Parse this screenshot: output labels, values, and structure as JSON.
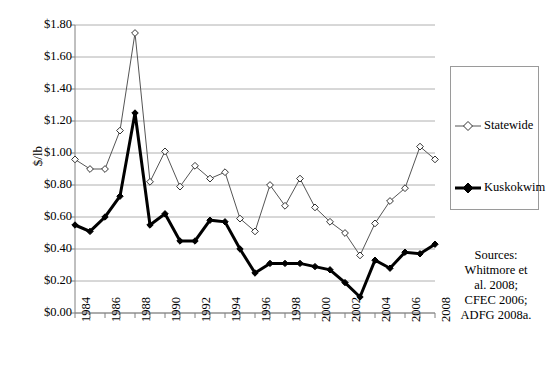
{
  "chart_data": {
    "type": "line",
    "title": "",
    "xlabel": "",
    "ylabel": "$/lb",
    "ylim": [
      0,
      1.8
    ],
    "ytick_step": 0.2,
    "ytick_labels": [
      "$0.00",
      "$0.20",
      "$0.40",
      "$0.60",
      "$0.80",
      "$1.00",
      "$1.20",
      "$1.40",
      "$1.60",
      "$1.80"
    ],
    "x": [
      1984,
      1985,
      1986,
      1987,
      1988,
      1989,
      1990,
      1991,
      1992,
      1993,
      1994,
      1995,
      1996,
      1997,
      1998,
      1999,
      2000,
      2001,
      2002,
      2003,
      2004,
      2005,
      2006,
      2007,
      2008
    ],
    "xtick_labels": [
      "1984",
      "1986",
      "1988",
      "1990",
      "1992",
      "1994",
      "1996",
      "1998",
      "2000",
      "2002",
      "2004",
      "2006",
      "2008"
    ],
    "xtick_values": [
      1984,
      1986,
      1988,
      1990,
      1992,
      1994,
      1996,
      1998,
      2000,
      2002,
      2004,
      2006,
      2008
    ],
    "grid": "horizontal",
    "legend_position": "right",
    "series": [
      {
        "name": "Statewide",
        "color": "#555555",
        "marker": "diamond-open",
        "line_width": 1,
        "values": [
          0.96,
          0.9,
          0.9,
          1.14,
          1.75,
          0.82,
          1.01,
          0.79,
          0.92,
          0.84,
          0.88,
          0.59,
          0.51,
          0.8,
          0.67,
          0.84,
          0.66,
          0.57,
          0.5,
          0.36,
          0.56,
          0.7,
          0.78,
          1.04,
          0.96
        ]
      },
      {
        "name": "Kuskokwim",
        "color": "#000000",
        "marker": "diamond-filled",
        "line_width": 3,
        "values": [
          0.55,
          0.51,
          0.6,
          0.73,
          1.25,
          0.55,
          0.62,
          0.45,
          0.45,
          0.58,
          0.57,
          0.4,
          0.25,
          0.31,
          0.31,
          0.31,
          0.29,
          0.27,
          0.19,
          0.1,
          0.33,
          0.28,
          0.38,
          0.37,
          0.43
        ]
      }
    ]
  },
  "legend": {
    "entries": [
      {
        "label": "Statewide"
      },
      {
        "label": "Kuskokwim"
      }
    ]
  },
  "sources": {
    "lines": [
      "Sources:",
      "Whitmore et",
      "al. 2008;",
      "CFEC 2006;",
      "ADFG 2008a."
    ]
  },
  "colors": {
    "gridline": "#b0b0b0",
    "axis": "#808080",
    "statewide": "#555555",
    "kuskokwim": "#000000",
    "legend_border": "#9a9a9a"
  }
}
